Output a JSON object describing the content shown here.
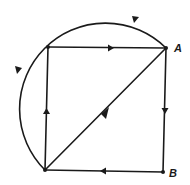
{
  "diagram": {
    "type": "directed-graph",
    "nodes": [
      {
        "id": "TL",
        "label": "",
        "x": 48,
        "y": 47
      },
      {
        "id": "A",
        "label": "A",
        "x": 166,
        "y": 48
      },
      {
        "id": "B",
        "label": "B",
        "x": 163,
        "y": 172
      },
      {
        "id": "BL",
        "label": "",
        "x": 45,
        "y": 170
      }
    ],
    "edges": [
      {
        "from": "TL",
        "to": "A",
        "kind": "straight"
      },
      {
        "from": "A",
        "to": "B",
        "kind": "straight"
      },
      {
        "from": "B",
        "to": "BL",
        "kind": "straight"
      },
      {
        "from": "BL",
        "to": "TL",
        "kind": "straight"
      },
      {
        "from": "BL",
        "to": "A",
        "kind": "straight-diagonal"
      },
      {
        "from": "A",
        "to": "BL",
        "kind": "circular-arc",
        "direction": "counterclockwise"
      }
    ],
    "labels": {
      "A": "A",
      "B": "B"
    },
    "color": "#1a1a1a"
  }
}
